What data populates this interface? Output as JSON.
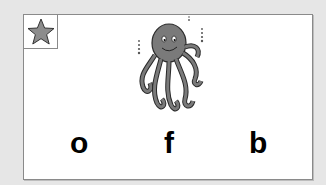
{
  "activity": {
    "star_icon": "star-icon",
    "picture": "octopus",
    "choices": [
      {
        "letter": "o"
      },
      {
        "letter": "f"
      },
      {
        "letter": "b"
      }
    ]
  },
  "colors": {
    "background": "#e6e6e6",
    "card": "#ffffff",
    "border": "#8a8a8a",
    "star_fill": "#8c8c8c",
    "octopus_fill": "#7a7a7a",
    "letter": "#000000"
  }
}
